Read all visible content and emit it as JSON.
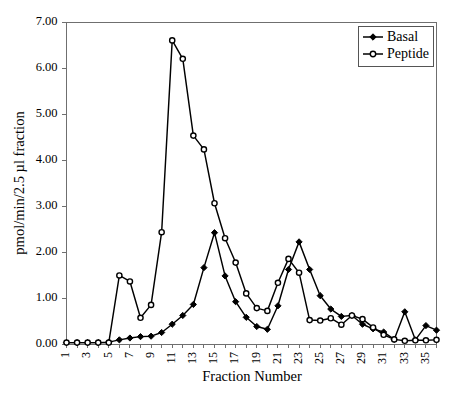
{
  "chart_data": {
    "type": "line",
    "title": "",
    "xlabel": "Fraction Number",
    "ylabel": "pmol/min/2.5 µl fraction",
    "xlim": [
      1,
      36
    ],
    "ylim": [
      0.0,
      7.0
    ],
    "yticks": [
      "0.00",
      "1.00",
      "2.00",
      "3.00",
      "4.00",
      "5.00",
      "6.00",
      "7.00"
    ],
    "ytick_values": [
      0,
      1,
      2,
      3,
      4,
      5,
      6,
      7
    ],
    "x": [
      1,
      2,
      3,
      4,
      5,
      6,
      7,
      8,
      9,
      10,
      11,
      12,
      13,
      14,
      15,
      16,
      17,
      18,
      19,
      20,
      21,
      22,
      23,
      24,
      25,
      26,
      27,
      28,
      29,
      30,
      31,
      32,
      33,
      34,
      35,
      36
    ],
    "xtick_labels": [
      "1",
      "",
      "3",
      "",
      "5",
      "",
      "7",
      "",
      "9",
      "",
      "11",
      "",
      "13",
      "",
      "15",
      "",
      "17",
      "",
      "19",
      "",
      "21",
      "",
      "23",
      "",
      "25",
      "",
      "27",
      "",
      "29",
      "",
      "31",
      "",
      "33",
      "",
      "35",
      ""
    ],
    "grid": false,
    "legend_position": "top-right",
    "series": [
      {
        "name": "Basal",
        "marker": "filled-diamond",
        "values": [
          0.03,
          0.03,
          0.03,
          0.03,
          0.04,
          0.09,
          0.13,
          0.16,
          0.17,
          0.25,
          0.43,
          0.62,
          0.86,
          1.66,
          2.42,
          1.48,
          0.92,
          0.58,
          0.38,
          0.32,
          0.83,
          1.62,
          2.22,
          1.62,
          1.05,
          0.76,
          0.6,
          0.62,
          0.43,
          0.33,
          0.26,
          0.1,
          0.7,
          0.09,
          0.4,
          0.3
        ]
      },
      {
        "name": "Peptide",
        "marker": "open-circle",
        "values": [
          0.03,
          0.03,
          0.03,
          0.03,
          0.03,
          1.49,
          1.36,
          0.57,
          0.85,
          2.43,
          6.6,
          6.2,
          4.53,
          4.23,
          3.06,
          2.3,
          1.77,
          1.1,
          0.78,
          0.72,
          1.33,
          1.85,
          1.55,
          0.52,
          0.51,
          0.56,
          0.42,
          0.62,
          0.54,
          0.36,
          0.2,
          0.1,
          0.07,
          0.08,
          0.08,
          0.09
        ]
      }
    ]
  },
  "legend": {
    "items": [
      {
        "label": "Basal"
      },
      {
        "label": "Peptide"
      }
    ]
  },
  "axes": {
    "x_title": "Fraction Number",
    "y_title": "pmol/min/2.5 µl fraction"
  },
  "colors": {
    "series_stroke": "#000000",
    "axis": "#6f6f6f",
    "background": "#ffffff"
  }
}
